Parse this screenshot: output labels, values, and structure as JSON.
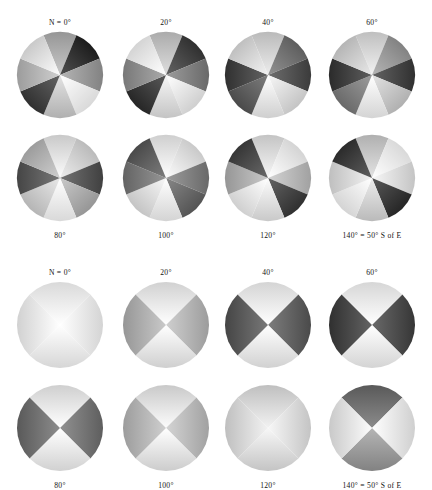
{
  "figure": {
    "background_color": "#ffffff",
    "panels": [
      {
        "id": "upper",
        "name": "eight-sector-discs",
        "sector_count": 8,
        "rows": [
          {
            "label_position": "above",
            "discs": [
              {
                "label": "N = 0°",
                "azimuth_deg": 0
              },
              {
                "label": "20°",
                "azimuth_deg": 20
              },
              {
                "label": "40°",
                "azimuth_deg": 40
              },
              {
                "label": "60°",
                "azimuth_deg": 60
              }
            ]
          },
          {
            "label_position": "below",
            "discs": [
              {
                "label": "80°",
                "azimuth_deg": 80
              },
              {
                "label": "100°",
                "azimuth_deg": 100
              },
              {
                "label": "120°",
                "azimuth_deg": 120
              },
              {
                "label": "140° = 50° S of E",
                "azimuth_deg": 140,
                "wide": true
              }
            ]
          }
        ]
      },
      {
        "id": "lower",
        "name": "four-sector-discs",
        "sector_count": 4,
        "rows": [
          {
            "label_position": "above",
            "discs": [
              {
                "label": "N = 0°",
                "azimuth_deg": 0
              },
              {
                "label": "20°",
                "azimuth_deg": 20
              },
              {
                "label": "40°",
                "azimuth_deg": 40
              },
              {
                "label": "60°",
                "azimuth_deg": 60
              }
            ]
          },
          {
            "label_position": "below",
            "discs": [
              {
                "label": "80°",
                "azimuth_deg": 80
              },
              {
                "label": "100°",
                "azimuth_deg": 100
              },
              {
                "label": "120°",
                "azimuth_deg": 120
              },
              {
                "label": "140° = 50° S of E",
                "azimuth_deg": 140,
                "wide": true
              }
            ]
          }
        ]
      }
    ]
  },
  "chart_data": {
    "type": "pie",
    "title": "",
    "xlabel": "",
    "ylabel": "",
    "legend": "none",
    "grid": false,
    "radius_px": 43,
    "greys": {
      "darkest": "#3b3b3b",
      "dark": "#6a6a6a",
      "mid": "#9a9a9a",
      "light": "#c9c9c9",
      "lightest": "#efefef"
    },
    "panels": [
      {
        "name": "eight-sector-discs",
        "sector_count": 8,
        "sector_span_deg": 45,
        "categories": [
          "0",
          "45",
          "90",
          "135",
          "180",
          "225",
          "270",
          "315"
        ],
        "series": [
          {
            "name": "N = 0°",
            "azimuth_deg": 0,
            "values": [
              70,
              22,
              62,
              96,
              80,
              30,
              72,
              90
            ]
          },
          {
            "name": "20°",
            "azimuth_deg": 20,
            "values": [
              78,
              30,
              52,
              92,
              88,
              26,
              58,
              94
            ]
          },
          {
            "name": "40°",
            "azimuth_deg": 40,
            "values": [
              84,
              48,
              34,
              88,
              92,
              40,
              30,
              86
            ]
          },
          {
            "name": "60°",
            "azimuth_deg": 60,
            "values": [
              86,
              62,
              30,
              80,
              94,
              52,
              28,
              82
            ]
          },
          {
            "name": "80°",
            "azimuth_deg": 80,
            "values": [
              90,
              84,
              36,
              70,
              96,
              82,
              38,
              72
            ]
          },
          {
            "name": "100°",
            "azimuth_deg": 100,
            "values": [
              92,
              90,
              52,
              44,
              94,
              88,
              50,
              40
            ]
          },
          {
            "name": "120°",
            "azimuth_deg": 120,
            "values": [
              88,
              94,
              74,
              30,
              90,
              92,
              70,
              32
            ]
          },
          {
            "name": "140° = 50° S of E",
            "azimuth_deg": 140,
            "values": [
              80,
              96,
              88,
              26,
              84,
              94,
              86,
              28
            ]
          }
        ]
      },
      {
        "name": "four-sector-discs",
        "sector_count": 4,
        "sector_span_deg": 90,
        "categories": [
          "0",
          "90",
          "180",
          "270"
        ],
        "series": [
          {
            "name": "N = 0°",
            "azimuth_deg": 0,
            "values": [
              96,
              94,
              95,
              93
            ]
          },
          {
            "name": "20°",
            "azimuth_deg": 20,
            "values": [
              93,
              72,
              92,
              70
            ]
          },
          {
            "name": "40°",
            "azimuth_deg": 40,
            "values": [
              94,
              40,
              93,
              38
            ]
          },
          {
            "name": "60°",
            "azimuth_deg": 60,
            "values": [
              95,
              32,
              94,
              30
            ]
          },
          {
            "name": "80°",
            "azimuth_deg": 80,
            "values": [
              92,
              48,
              93,
              46
            ]
          },
          {
            "name": "100°",
            "azimuth_deg": 100,
            "values": [
              90,
              74,
              91,
              72
            ]
          },
          {
            "name": "120°",
            "azimuth_deg": 120,
            "values": [
              86,
              88,
              88,
              86
            ]
          },
          {
            "name": "140° = 50° S of E",
            "azimuth_deg": 140,
            "values": [
              46,
              92,
              62,
              90
            ]
          }
        ]
      }
    ]
  }
}
